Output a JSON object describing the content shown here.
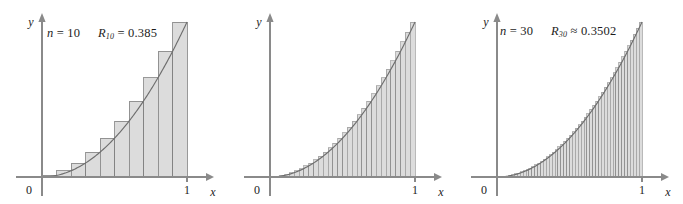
{
  "figure": {
    "background": "#ffffff",
    "panel_count": 3
  },
  "style": {
    "bar_fill": "#dcdcdc",
    "bar_stroke": "#808080",
    "curve_color": "#6e6e6e",
    "axis_color": "#8a8a8a",
    "text_color": "#1c1c1c"
  },
  "panels": [
    {
      "id": "panel-n10",
      "n_label": "n",
      "n_equals": "=",
      "n_value": "10",
      "r_symbol": "R",
      "r_subscript": "10",
      "r_relation": "=",
      "r_value": "0.385",
      "y_axis_label": "y",
      "x_axis_label": "x",
      "tick_origin": "0",
      "tick_one": "1"
    },
    {
      "id": "panel-n30",
      "n_label": "n",
      "n_equals": "=",
      "n_value": "30",
      "r_symbol": "R",
      "r_subscript": "30",
      "r_relation": "≈",
      "r_value": "0.3502",
      "y_axis_label": "y",
      "x_axis_label": "x",
      "tick_origin": "0",
      "tick_one": "1"
    },
    {
      "id": "panel-n50",
      "n_label": "n",
      "n_equals": "=",
      "n_value": "50",
      "r_symbol": "R",
      "r_subscript": "50",
      "r_relation": "≈",
      "r_value": "0.3434",
      "y_axis_label": "y",
      "x_axis_label": "x",
      "tick_origin": "0",
      "tick_one": "1"
    }
  ],
  "chart_data": [
    {
      "type": "bar",
      "title": "n = 10   R_10 = 0.385",
      "xlabel": "x",
      "ylabel": "y",
      "xlim": [
        0,
        1
      ],
      "ylim": [
        0,
        1
      ],
      "xticks": [
        0,
        1
      ],
      "xticklabels": [
        "0",
        "1"
      ],
      "grid": false,
      "legend": null,
      "function": "y = x^2",
      "riemann": "right endpoints",
      "n": 10,
      "sum_value": 0.385,
      "bar_width": 0.1,
      "categories": [
        0.1,
        0.2,
        0.3,
        0.4,
        0.5,
        0.6,
        0.7,
        0.8,
        0.9,
        1.0
      ],
      "values": [
        0.01,
        0.04,
        0.09,
        0.16,
        0.25,
        0.36,
        0.49,
        0.64,
        0.81,
        1.0
      ],
      "curve": {
        "x": [
          0,
          0.1,
          0.2,
          0.3,
          0.4,
          0.5,
          0.6,
          0.7,
          0.8,
          0.9,
          1.0
        ],
        "y": [
          0,
          0.01,
          0.04,
          0.09,
          0.16,
          0.25,
          0.36,
          0.49,
          0.64,
          0.81,
          1.0
        ]
      }
    },
    {
      "type": "bar",
      "title": "n = 30   R_30 ≈ 0.3502",
      "xlabel": "x",
      "ylabel": "y",
      "xlim": [
        0,
        1
      ],
      "ylim": [
        0,
        1
      ],
      "xticks": [
        0,
        1
      ],
      "xticklabels": [
        "0",
        "1"
      ],
      "grid": false,
      "legend": null,
      "function": "y = x^2",
      "riemann": "right endpoints",
      "n": 30,
      "sum_value": 0.3502,
      "bar_width": 0.03333,
      "curve": {
        "x": [
          0,
          0.125,
          0.25,
          0.375,
          0.5,
          0.625,
          0.75,
          0.875,
          1.0
        ],
        "y": [
          0,
          0.015625,
          0.0625,
          0.140625,
          0.25,
          0.390625,
          0.5625,
          0.765625,
          1.0
        ]
      }
    },
    {
      "type": "bar",
      "title": "n = 50   R_50 ≈ 0.3434",
      "xlabel": "x",
      "ylabel": "y",
      "xlim": [
        0,
        1
      ],
      "ylim": [
        0,
        1
      ],
      "xticks": [
        0,
        1
      ],
      "xticklabels": [
        "0",
        "1"
      ],
      "grid": false,
      "legend": null,
      "function": "y = x^2",
      "riemann": "right endpoints",
      "n": 50,
      "sum_value": 0.3434,
      "bar_width": 0.02,
      "curve": {
        "x": [
          0,
          0.125,
          0.25,
          0.375,
          0.5,
          0.625,
          0.75,
          0.875,
          1.0
        ],
        "y": [
          0,
          0.015625,
          0.0625,
          0.140625,
          0.25,
          0.390625,
          0.5625,
          0.765625,
          1.0
        ]
      }
    }
  ]
}
